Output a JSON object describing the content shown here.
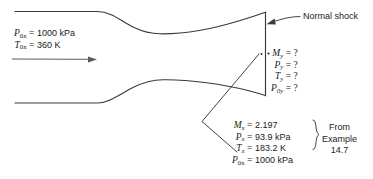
{
  "figure": {
    "line_color": "#3a3a3a",
    "text_color": "#1d1d1d",
    "background": "#ffffff"
  },
  "inlet": {
    "stagnation_pressure": {
      "symbol": "P",
      "subscript": "0x",
      "equals": "=",
      "value": "1000 kPa"
    },
    "stagnation_temperature": {
      "symbol": "T",
      "subscript": "0x",
      "equals": "=",
      "value": "360 K"
    }
  },
  "shock": {
    "label": "Normal shock"
  },
  "downstream": {
    "rows": [
      {
        "symbol": "M",
        "subscript": "y",
        "equals": "=",
        "value": "?"
      },
      {
        "symbol": "P",
        "subscript": "y",
        "equals": "=",
        "value": "?"
      },
      {
        "symbol": "T",
        "subscript": "y",
        "equals": "=",
        "value": "?"
      },
      {
        "symbol": "P",
        "subscript": "0y",
        "equals": "=",
        "value": "?"
      }
    ]
  },
  "upstream": {
    "rows": [
      {
        "symbol": "M",
        "subscript": "x",
        "equals": "=",
        "value": "2.197"
      },
      {
        "symbol": "P",
        "subscript": "x",
        "equals": "=",
        "value": "93.9 kPa"
      },
      {
        "symbol": "T",
        "subscript": "x",
        "equals": "=",
        "value": "183.2 K"
      },
      {
        "symbol": "P",
        "subscript": "0x",
        "equals": "=",
        "value": "1000 kPa"
      }
    ],
    "source": {
      "line1": "From",
      "line2": "Example",
      "line3": "14.7"
    }
  }
}
